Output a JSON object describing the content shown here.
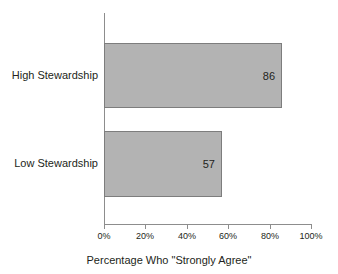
{
  "chart_data": {
    "type": "bar",
    "orientation": "horizontal",
    "title": "",
    "xlabel": "Percentage Who \"Strongly Agree\"",
    "ylabel": "",
    "categories": [
      "High Stewardship",
      "Low Stewardship"
    ],
    "values": [
      86,
      57
    ],
    "value_labels": [
      "86",
      "57"
    ],
    "xlim": [
      0,
      100
    ],
    "xticks": [
      0,
      20,
      40,
      60,
      80,
      100
    ],
    "xtick_labels": [
      "0%",
      "20%",
      "40%",
      "60%",
      "80%",
      "100%"
    ],
    "grid": false,
    "legend": false,
    "bar_fill_color": "#b3b3b3",
    "bar_border_color": "#7d7d7d",
    "axis_color": "#8d8d8d",
    "background_color": "#ffffff",
    "text_color": "#231f20"
  }
}
